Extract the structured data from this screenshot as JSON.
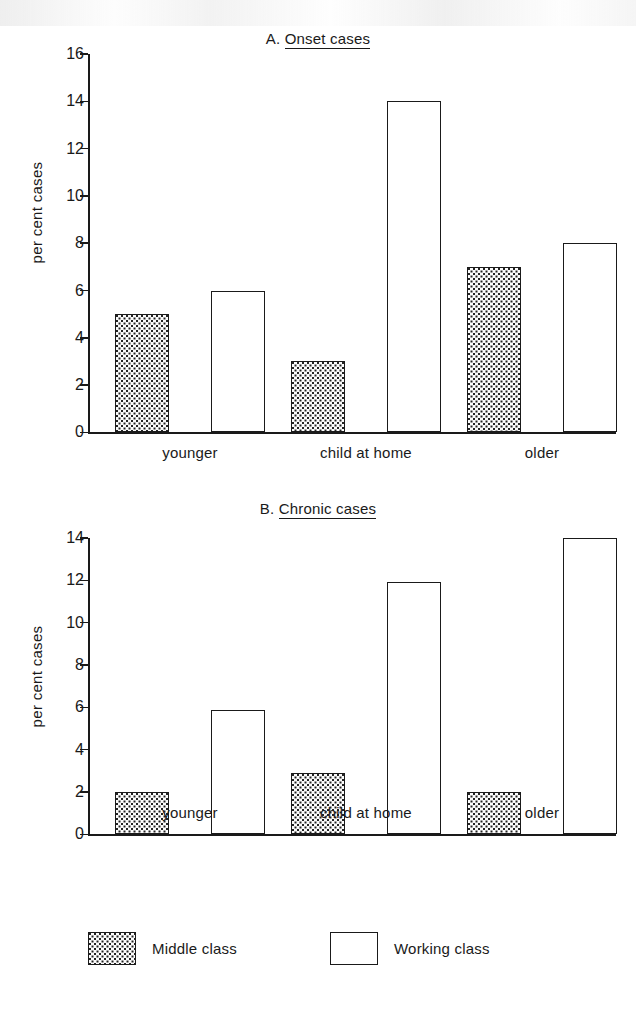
{
  "figure": {
    "background": "#ffffff",
    "ink_color": "#1a1a1a"
  },
  "legend": {
    "position": "bottom",
    "entries": [
      {
        "label": "Middle class",
        "pattern": "dotted",
        "swatch_name": "legend-swatch-middle-class"
      },
      {
        "label": "Working class",
        "pattern": "white",
        "swatch_name": "legend-swatch-working-class"
      }
    ]
  },
  "chart_data": [
    {
      "id": "panel-a",
      "type": "bar",
      "title": "A. Onset cases",
      "title_prefix": "A.",
      "title_main": "Onset cases",
      "xlabel": "",
      "ylabel": "per cent cases",
      "ylim": [
        0,
        16
      ],
      "yticks": [
        0,
        2,
        4,
        6,
        8,
        10,
        12,
        14,
        16
      ],
      "ytick_labels": [
        "0",
        "2",
        "4",
        "6",
        "8",
        "10",
        "12",
        "14",
        "16"
      ],
      "grid": false,
      "categories": [
        "younger",
        "child at home",
        "older"
      ],
      "series": [
        {
          "name": "Middle class",
          "pattern": "dotted",
          "values": [
            5,
            3,
            7
          ]
        },
        {
          "name": "Working class",
          "pattern": "white",
          "values": [
            6,
            14,
            8
          ]
        }
      ]
    },
    {
      "id": "panel-b",
      "type": "bar",
      "title": "B. Chronic cases",
      "title_prefix": "B.",
      "title_main": "Chronic cases",
      "xlabel": "",
      "ylabel": "per cent cases",
      "ylim": [
        0,
        14
      ],
      "yticks": [
        0,
        2,
        4,
        6,
        8,
        10,
        12,
        14
      ],
      "ytick_labels": [
        "0",
        "2",
        "4",
        "6",
        "8",
        "10",
        "12",
        "14"
      ],
      "grid": false,
      "categories": [
        "younger",
        "child at home",
        "older"
      ],
      "series": [
        {
          "name": "Middle class",
          "pattern": "dotted",
          "values": [
            2,
            2.9,
            2
          ]
        },
        {
          "name": "Working class",
          "pattern": "white",
          "values": [
            5.9,
            11.9,
            14
          ]
        }
      ]
    }
  ]
}
